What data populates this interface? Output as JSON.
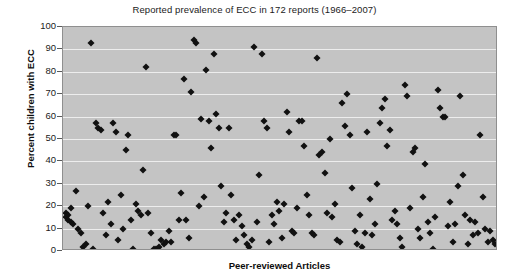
{
  "chart_data": {
    "type": "scatter",
    "title": "Reported prevalence of ECC in 172 reports (1966–2007)",
    "xlabel": "Peer-reviewed Articles",
    "ylabel": "Percent children with ECC",
    "ylim": [
      0,
      100
    ],
    "ytick_labels": [
      "100",
      "90",
      "80",
      "70",
      "60",
      "50",
      "40",
      "30",
      "20",
      "10",
      "0"
    ],
    "yticks": [
      100,
      90,
      80,
      70,
      60,
      50,
      40,
      30,
      20,
      10,
      0
    ],
    "xlim": [
      0,
      173
    ],
    "xtick_labels": [],
    "grid": "horizontal",
    "legend": "none",
    "marker": "diamond",
    "marker_color": "#111111",
    "plot_background": "#c4c4c4",
    "gridline_color": "#ededed",
    "n_points": 172,
    "points": [
      [
        1,
        17
      ],
      [
        1,
        15
      ],
      [
        2,
        16
      ],
      [
        2,
        14
      ],
      [
        3,
        19
      ],
      [
        3,
        13
      ],
      [
        4,
        12
      ],
      [
        5,
        27
      ],
      [
        6,
        10
      ],
      [
        7,
        8
      ],
      [
        8,
        2
      ],
      [
        9,
        3
      ],
      [
        10,
        20
      ],
      [
        11,
        93
      ],
      [
        12,
        1
      ],
      [
        13,
        57
      ],
      [
        14,
        55
      ],
      [
        15,
        54
      ],
      [
        16,
        17
      ],
      [
        17,
        7
      ],
      [
        18,
        22
      ],
      [
        19,
        12
      ],
      [
        20,
        57
      ],
      [
        21,
        53
      ],
      [
        22,
        5
      ],
      [
        23,
        25
      ],
      [
        24,
        10
      ],
      [
        25,
        45
      ],
      [
        26,
        52
      ],
      [
        27,
        14
      ],
      [
        28,
        1
      ],
      [
        29,
        21
      ],
      [
        30,
        18
      ],
      [
        31,
        16
      ],
      [
        32,
        36
      ],
      [
        33,
        82
      ],
      [
        34,
        17
      ],
      [
        35,
        8
      ],
      [
        36,
        1
      ],
      [
        37,
        1
      ],
      [
        38,
        2
      ],
      [
        39,
        5
      ],
      [
        40,
        3
      ],
      [
        41,
        4
      ],
      [
        42,
        9
      ],
      [
        43,
        4
      ],
      [
        44,
        52
      ],
      [
        45,
        52
      ],
      [
        46,
        14
      ],
      [
        47,
        26
      ],
      [
        48,
        77
      ],
      [
        49,
        14
      ],
      [
        50,
        6
      ],
      [
        51,
        71
      ],
      [
        52,
        94
      ],
      [
        53,
        93
      ],
      [
        54,
        20
      ],
      [
        55,
        59
      ],
      [
        56,
        24
      ],
      [
        57,
        81
      ],
      [
        58,
        58
      ],
      [
        59,
        46
      ],
      [
        60,
        88
      ],
      [
        61,
        61
      ],
      [
        62,
        55
      ],
      [
        63,
        29
      ],
      [
        64,
        13
      ],
      [
        65,
        17
      ],
      [
        66,
        55
      ],
      [
        67,
        25
      ],
      [
        68,
        14
      ],
      [
        69,
        5
      ],
      [
        70,
        16
      ],
      [
        71,
        11
      ],
      [
        72,
        7
      ],
      [
        73,
        3
      ],
      [
        74,
        2
      ],
      [
        75,
        5
      ],
      [
        76,
        91
      ],
      [
        77,
        13
      ],
      [
        78,
        34
      ],
      [
        79,
        88
      ],
      [
        80,
        58
      ],
      [
        81,
        55
      ],
      [
        82,
        4
      ],
      [
        83,
        16
      ],
      [
        84,
        12
      ],
      [
        85,
        22
      ],
      [
        86,
        18
      ],
      [
        87,
        6
      ],
      [
        88,
        21
      ],
      [
        89,
        62
      ],
      [
        90,
        53
      ],
      [
        91,
        9
      ],
      [
        92,
        8
      ],
      [
        93,
        19
      ],
      [
        94,
        58
      ],
      [
        95,
        58
      ],
      [
        96,
        47
      ],
      [
        97,
        25
      ],
      [
        98,
        16
      ],
      [
        99,
        8
      ],
      [
        100,
        7
      ],
      [
        101,
        86
      ],
      [
        102,
        43
      ],
      [
        103,
        44
      ],
      [
        104,
        35
      ],
      [
        105,
        17
      ],
      [
        106,
        50
      ],
      [
        107,
        15
      ],
      [
        108,
        21
      ],
      [
        109,
        5
      ],
      [
        110,
        4
      ],
      [
        111,
        66
      ],
      [
        112,
        56
      ],
      [
        113,
        70
      ],
      [
        114,
        52
      ],
      [
        115,
        28
      ],
      [
        116,
        9
      ],
      [
        117,
        3
      ],
      [
        118,
        16
      ],
      [
        119,
        2
      ],
      [
        120,
        8
      ],
      [
        121,
        53
      ],
      [
        122,
        23
      ],
      [
        123,
        7
      ],
      [
        124,
        12
      ],
      [
        125,
        30
      ],
      [
        126,
        57
      ],
      [
        127,
        64
      ],
      [
        128,
        68
      ],
      [
        129,
        47
      ],
      [
        130,
        54
      ],
      [
        131,
        14
      ],
      [
        132,
        18
      ],
      [
        133,
        12
      ],
      [
        134,
        6
      ],
      [
        135,
        2
      ],
      [
        136,
        74
      ],
      [
        137,
        69
      ],
      [
        138,
        19
      ],
      [
        139,
        44
      ],
      [
        140,
        46
      ],
      [
        141,
        10
      ],
      [
        142,
        6
      ],
      [
        143,
        24
      ],
      [
        144,
        39
      ],
      [
        145,
        13
      ],
      [
        146,
        8
      ],
      [
        147,
        1
      ],
      [
        148,
        15
      ],
      [
        149,
        72
      ],
      [
        150,
        64
      ],
      [
        151,
        60
      ],
      [
        152,
        60
      ],
      [
        153,
        11
      ],
      [
        154,
        22
      ],
      [
        155,
        4
      ],
      [
        156,
        12
      ],
      [
        157,
        29
      ],
      [
        158,
        69
      ],
      [
        159,
        34
      ],
      [
        160,
        16
      ],
      [
        161,
        3
      ],
      [
        162,
        14
      ],
      [
        163,
        7
      ],
      [
        164,
        13
      ],
      [
        165,
        8
      ],
      [
        166,
        52
      ],
      [
        167,
        24
      ],
      [
        168,
        10
      ],
      [
        169,
        4
      ],
      [
        170,
        9
      ],
      [
        171,
        5
      ],
      [
        172,
        3
      ]
    ]
  }
}
